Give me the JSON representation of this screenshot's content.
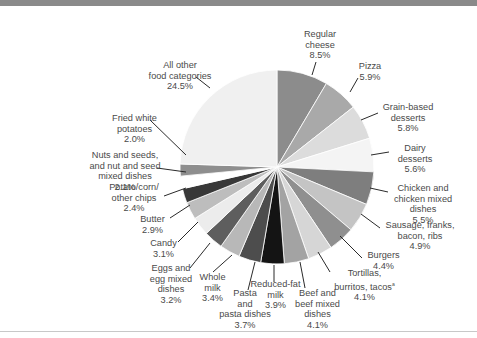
{
  "chart_data": {
    "type": "pie",
    "title": "",
    "start_angle_deg": 0,
    "direction": "clockwise",
    "slices": [
      {
        "label": "Regular cheese",
        "value": 8.5,
        "color": "#8c8c8c"
      },
      {
        "label": "Pizza",
        "value": 5.9,
        "color": "#a9a9a9"
      },
      {
        "label": "Grain-based desserts",
        "value": 5.8,
        "color": "#dcdcdc"
      },
      {
        "label": "Dairy desserts",
        "value": 5.6,
        "color": "#f4f4f4"
      },
      {
        "label": "Chicken and chicken mixed dishes",
        "value": 5.5,
        "color": "#7e7e7e"
      },
      {
        "label": "Sausage, franks, bacon, ribs",
        "value": 4.9,
        "color": "#c4c4c4"
      },
      {
        "label": "Burgers",
        "value": 4.4,
        "color": "#8f8f8f"
      },
      {
        "label": "Tortillas, burritos, tacos",
        "value": 4.1,
        "color": "#d6d6d6"
      },
      {
        "label": "Beef and beef mixed dishes",
        "value": 4.1,
        "color": "#a3a3a3"
      },
      {
        "label": "Reduced-fat milk",
        "value": 3.9,
        "color": "#141414"
      },
      {
        "label": "Pasta and pasta dishes",
        "value": 3.7,
        "color": "#4d4d4d"
      },
      {
        "label": "Whole milk",
        "value": 3.4,
        "color": "#b8b8b8"
      },
      {
        "label": "Eggs and egg mixed dishes",
        "value": 3.2,
        "color": "#5e5e5e"
      },
      {
        "label": "Candy",
        "value": 3.1,
        "color": "#ececec"
      },
      {
        "label": "Butter",
        "value": 2.9,
        "color": "#bdbdbd"
      },
      {
        "label": "Potato/corn/other chips",
        "value": 2.4,
        "color": "#383838"
      },
      {
        "label": "Nuts and seeds, and nut and seed mixed dishes",
        "value": 2.1,
        "color": "#ffffff"
      },
      {
        "label": "Fried white potatoes",
        "value": 2.0,
        "color": "#8e8e8e"
      },
      {
        "label": "All other food categories",
        "value": 24.5,
        "color": "#f0f0f0"
      }
    ],
    "unit": "%"
  },
  "labels": {
    "cheese": {
      "l1": "Regular",
      "l2": "cheese",
      "pct": "8.5%"
    },
    "pizza": {
      "l1": "Pizza",
      "pct": "5.9%"
    },
    "grain": {
      "l1": "Grain-based",
      "l2": "desserts",
      "pct": "5.8%"
    },
    "dairy": {
      "l1": "Dairy",
      "l2": "desserts",
      "pct": "5.6%"
    },
    "chicken": {
      "l1": "Chicken and",
      "l2": "chicken mixed",
      "l3": "dishes",
      "pct": "5.5%"
    },
    "sausage": {
      "l1": "Sausage, franks,",
      "l2": "bacon, ribs",
      "pct": "4.9%"
    },
    "burgers": {
      "l1": "Burgers",
      "pct": "4.4%"
    },
    "tortillas": {
      "l1": "Tortillas,",
      "l2": "burritos, tacos",
      "sup": "a",
      "pct": "4.1%"
    },
    "beef": {
      "l1": "Beef and",
      "l2": "beef mixed",
      "l3": "dishes",
      "pct": "4.1%"
    },
    "rfmilk": {
      "l1": "Reduced-fat",
      "l2": "milk",
      "pct": "3.9%"
    },
    "pasta": {
      "l1": "Pasta",
      "l2": "and",
      "l3": "pasta dishes",
      "pct": "3.7%"
    },
    "wmilk": {
      "l1": "Whole",
      "l2": "milk",
      "pct": "3.4%"
    },
    "eggs": {
      "l1": "Eggs and",
      "l2": "egg mixed",
      "l3": "dishes",
      "pct": "3.2%"
    },
    "candy": {
      "l1": "Candy",
      "pct": "3.1%"
    },
    "butter": {
      "l1": "Butter",
      "pct": "2.9%"
    },
    "chips": {
      "l1": "Potato/corn/",
      "l2": "other chips",
      "pct": "2.4%"
    },
    "nuts": {
      "l1": "Nuts and seeds,",
      "l2": "and nut and seed",
      "l3": "mixed dishes",
      "pct": "2.1%"
    },
    "fried": {
      "l1": "Fried white",
      "l2": "potatoes",
      "pct": "2.0%"
    },
    "other": {
      "l1": "All other",
      "l2": "food categories",
      "pct": "24.5%"
    }
  }
}
